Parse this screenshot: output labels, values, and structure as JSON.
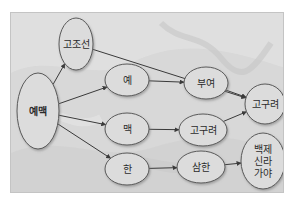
{
  "diagram": {
    "nodes": [
      {
        "id": "yemaek",
        "label": "예맥",
        "cx": 37,
        "cy": 110,
        "rx": 21,
        "ry": 38,
        "bold": true
      },
      {
        "id": "gojoseon",
        "label": "고조선",
        "cx": 75,
        "cy": 43,
        "rx": 17,
        "ry": 26
      },
      {
        "id": "ye",
        "label": "예",
        "cx": 126,
        "cy": 79,
        "rx": 22,
        "ry": 16
      },
      {
        "id": "maek",
        "label": "맥",
        "cx": 126,
        "cy": 128,
        "rx": 22,
        "ry": 16
      },
      {
        "id": "han",
        "label": "한",
        "cx": 126,
        "cy": 168,
        "rx": 22,
        "ry": 16
      },
      {
        "id": "buyeo",
        "label": "부여",
        "cx": 205,
        "cy": 82,
        "rx": 22,
        "ry": 16
      },
      {
        "id": "goguryeo_mid",
        "label": "고구려",
        "cx": 202,
        "cy": 129,
        "rx": 24,
        "ry": 16
      },
      {
        "id": "samhan",
        "label": "삼한",
        "cx": 200,
        "cy": 166,
        "rx": 24,
        "ry": 16
      },
      {
        "id": "goguryeo_right",
        "label": "고구려",
        "cx": 264,
        "cy": 103,
        "rx": 20,
        "ry": 20
      },
      {
        "id": "three_kingdoms",
        "label_lines": [
          "백제",
          "신라",
          "가야"
        ],
        "cx": 262,
        "cy": 160,
        "rx": 22,
        "ry": 28
      }
    ],
    "edges": [
      {
        "from": "yemaek",
        "to": "gojoseon"
      },
      {
        "from": "yemaek",
        "to": "ye"
      },
      {
        "from": "yemaek",
        "to": "maek"
      },
      {
        "from": "yemaek",
        "to": "han"
      },
      {
        "from": "gojoseon",
        "to": "goguryeo_right"
      },
      {
        "from": "ye",
        "to": "buyeo"
      },
      {
        "from": "buyeo",
        "to": "goguryeo_right"
      },
      {
        "from": "maek",
        "to": "goguryeo_mid"
      },
      {
        "from": "goguryeo_mid",
        "to": "goguryeo_right"
      },
      {
        "from": "han",
        "to": "samhan"
      },
      {
        "from": "samhan",
        "to": "three_kingdoms"
      }
    ],
    "colors": {
      "node_fill": "#dcdcdc",
      "node_stroke": "#5a5a5a",
      "edge": "#3a3a3a",
      "background": "#d9d9d9"
    }
  }
}
